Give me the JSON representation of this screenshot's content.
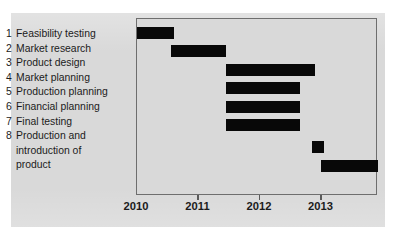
{
  "chart_data": {
    "type": "bar",
    "chart_subtype": "gantt",
    "title": "",
    "xlabel": "",
    "ylabel": "",
    "xlim": [
      2010.0,
      2013.92
    ],
    "grid": false,
    "legend": null,
    "axis_ticks": [
      {
        "label": "2010",
        "value": 2010
      },
      {
        "label": "2011",
        "value": 2011
      },
      {
        "label": "2012",
        "value": 2012
      },
      {
        "label": "2013",
        "value": 2013
      }
    ],
    "categories": [
      "Feasibility testing",
      "Market research",
      "Product design",
      "Market planning",
      "Production planning",
      "Financial planning",
      "Final testing",
      "Production and introduction of product"
    ],
    "tasks": [
      {
        "num": "1",
        "label": "Feasibility testing",
        "start": 2010.0,
        "end": 2010.6
      },
      {
        "num": "2",
        "label": "Market research",
        "start": 2010.55,
        "end": 2011.45
      },
      {
        "num": "3",
        "label": "Product design",
        "start": 2011.45,
        "end": 2012.9
      },
      {
        "num": "4",
        "label": "Market planning",
        "start": 2011.45,
        "end": 2012.65
      },
      {
        "num": "5",
        "label": "Production planning",
        "start": 2011.45,
        "end": 2012.65
      },
      {
        "num": "6",
        "label": "Financial planning",
        "start": 2011.45,
        "end": 2012.65
      },
      {
        "num": "7",
        "label": "Final testing",
        "start": 2012.85,
        "end": 2013.05
      },
      {
        "num": "8",
        "label": "Production and introduction of product",
        "start": 2013.0,
        "end": 2013.92
      }
    ],
    "bar_color": "#080808",
    "plot_background": "#d9d9d9"
  },
  "task_list": [
    {
      "num": "1",
      "label": "Feasibility testing",
      "continuation": []
    },
    {
      "num": "2",
      "label": "Market research",
      "continuation": []
    },
    {
      "num": "3",
      "label": "Product design",
      "continuation": []
    },
    {
      "num": "4",
      "label": "Market planning",
      "continuation": []
    },
    {
      "num": "5",
      "label": "Production planning",
      "continuation": []
    },
    {
      "num": "6",
      "label": "Financial planning",
      "continuation": []
    },
    {
      "num": "7",
      "label": "Final testing",
      "continuation": []
    },
    {
      "num": "8",
      "label": "Production and",
      "continuation": [
        "introduction of",
        "product"
      ]
    }
  ]
}
